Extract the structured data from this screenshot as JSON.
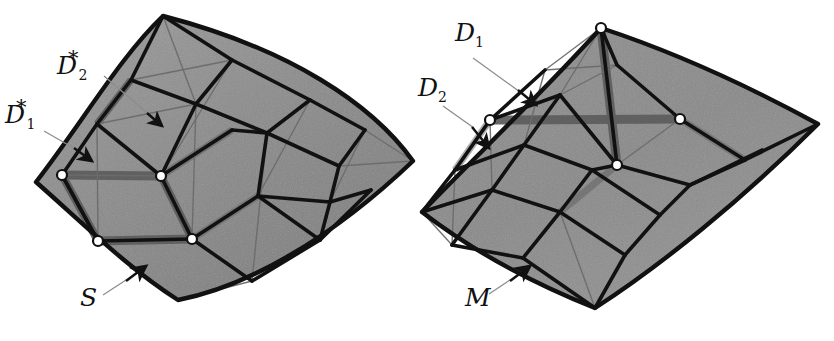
{
  "figure": {
    "type": "diagram",
    "background_color": "#ffffff",
    "mesh_fill_color": "#8a8a8a",
    "coarse_edge_color": "#111111",
    "fine_edge_color": "#6b6b6b",
    "ribbon_color": "#5e5e5e",
    "marker_fill_color": "#ffffff",
    "marker_stroke_color": "#111111",
    "leader_color": "#8d8d8d",
    "arrow_color": "#111111"
  },
  "left_panel": {
    "name": "source-surface",
    "surface_label": "S",
    "path_labels": [
      {
        "base": "D",
        "sub": "2",
        "sup": "*"
      },
      {
        "base": "D",
        "sub": "1",
        "sup": "*"
      }
    ]
  },
  "right_panel": {
    "name": "target-mesh",
    "surface_label": "M",
    "path_labels": [
      {
        "base": "D",
        "sub": "1",
        "sup": ""
      },
      {
        "base": "D",
        "sub": "2",
        "sup": ""
      }
    ]
  },
  "labels": {
    "d2star_base": "D",
    "d2star_sub": "2",
    "d2star_sup": "*",
    "d1star_base": "D",
    "d1star_sub": "1",
    "d1star_sup": "*",
    "s_label": "S",
    "d1_base": "D",
    "d1_sub": "1",
    "d2_base": "D",
    "d2_sub": "2",
    "m_label": "M"
  }
}
